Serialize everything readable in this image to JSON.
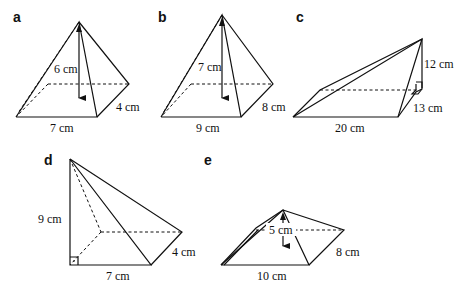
{
  "figures": {
    "a": {
      "label": "a",
      "height": "6 cm",
      "base_length": "7 cm",
      "base_width": "4 cm"
    },
    "b": {
      "label": "b",
      "height": "7 cm",
      "base_length": "9 cm",
      "base_width": "8 cm"
    },
    "c": {
      "label": "c",
      "height": "12 cm",
      "base_length": "20 cm",
      "base_width": "13 cm"
    },
    "d": {
      "label": "d",
      "height": "9 cm",
      "base_length": "7 cm",
      "base_width": "4 cm"
    },
    "e": {
      "label": "e",
      "height": "5 cm",
      "base_length": "10 cm",
      "base_width": "8 cm"
    }
  }
}
